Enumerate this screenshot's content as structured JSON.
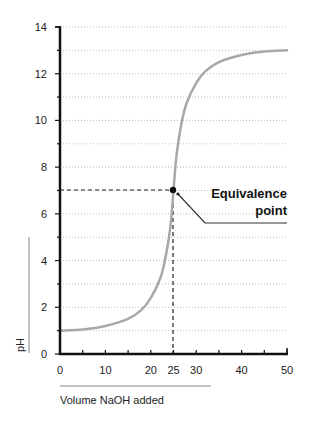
{
  "chart_data": {
    "type": "line",
    "title": "",
    "xlabel": "Volume NaOH added",
    "ylabel": "pH",
    "xlim": [
      0,
      50
    ],
    "ylim": [
      0,
      14
    ],
    "x_ticks": [
      0,
      10,
      20,
      25,
      30,
      40,
      50
    ],
    "x_tick_labels": [
      "0",
      "10",
      "20",
      "25",
      "30",
      "40",
      "50"
    ],
    "y_ticks": [
      0,
      2,
      4,
      6,
      8,
      10,
      12,
      14
    ],
    "y_tick_labels": [
      "0",
      "2",
      "4",
      "6",
      "8",
      "10",
      "12",
      "14"
    ],
    "grid": "horizontal dotted every 1 pH unit",
    "legend": null,
    "series": [
      {
        "name": "Titration curve",
        "color": "#a8a8a8",
        "x": [
          0,
          5,
          10,
          15,
          18,
          20,
          22,
          23,
          24,
          24.5,
          25,
          25.5,
          26,
          27,
          28,
          30,
          32,
          35,
          40,
          45,
          50
        ],
        "y": [
          1.0,
          1.05,
          1.2,
          1.5,
          1.9,
          2.4,
          3.2,
          3.9,
          5.0,
          5.8,
          7.0,
          8.2,
          9.0,
          10.1,
          10.8,
          11.6,
          12.1,
          12.5,
          12.8,
          12.95,
          13.0
        ]
      }
    ],
    "annotations": [
      {
        "text": "Equivalence point",
        "x": 25,
        "y": 7,
        "marker": "filled circle",
        "guide_lines": "dashed to x and y axes"
      }
    ]
  },
  "labels": {
    "y_axis_title": "pH",
    "x_axis_title": "Volume NaOH added",
    "annotation_line1": "Equivalence",
    "annotation_line2": "point",
    "x_ticks": [
      "0",
      "10",
      "20",
      "25",
      "30",
      "40",
      "50"
    ],
    "y_ticks": [
      "0",
      "2",
      "4",
      "6",
      "8",
      "10",
      "12",
      "14"
    ]
  }
}
